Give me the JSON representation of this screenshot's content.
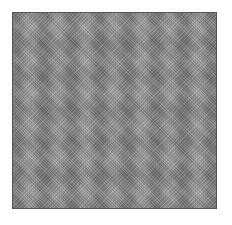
{
  "image": {
    "description": "Square gray noise texture with subtle wavy band modulation, thin dark border, on white background",
    "colors": {
      "background": "#ffffff",
      "texture_base": "#9a9a9a",
      "border": "#555555"
    }
  }
}
